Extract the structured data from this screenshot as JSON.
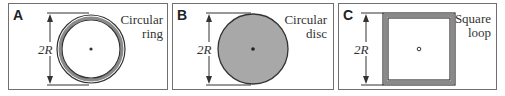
{
  "panels": [
    {
      "letter": "A",
      "caption_line1": "Circular",
      "caption_line2": "ring",
      "dimension_label": "2R",
      "shape": "ring"
    },
    {
      "letter": "B",
      "caption_line1": "Circular",
      "caption_line2": "disc",
      "dimension_label": "2R",
      "shape": "disc"
    },
    {
      "letter": "C",
      "caption_line1": "Square",
      "caption_line2": "loop",
      "dimension_label": "2R",
      "shape": "square-loop"
    }
  ],
  "colors": {
    "stroke": "#333333",
    "fill_gray": "#a8a8a8",
    "ring_gray": "#8a8a8a",
    "border": "#707070"
  }
}
